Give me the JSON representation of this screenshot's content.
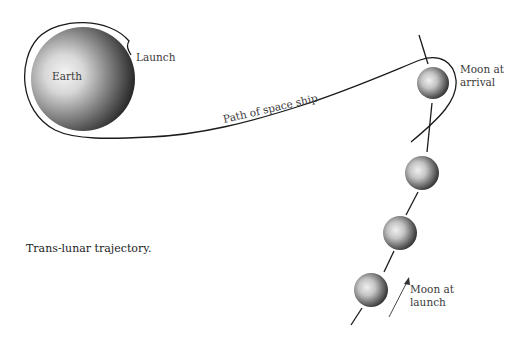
{
  "diagram": {
    "caption": "Trans-lunar trajectory.",
    "labels": {
      "earth": "Earth",
      "launch": "Launch",
      "path": "Path of space ship",
      "moon_arrival_line1": "Moon at",
      "moon_arrival_line2": "arrival",
      "moon_launch_line1": "Moon at",
      "moon_launch_line2": "launch"
    },
    "bodies": [
      {
        "name": "Earth",
        "cx": 83,
        "cy": 79,
        "r": 52
      },
      {
        "name": "Moon at arrival",
        "cx": 433,
        "cy": 83,
        "r": 16
      },
      {
        "name": "Moon position 2",
        "cx": 422,
        "cy": 173,
        "r": 17
      },
      {
        "name": "Moon position 3",
        "cx": 400,
        "cy": 233,
        "r": 17
      },
      {
        "name": "Moon at launch",
        "cx": 371,
        "cy": 290,
        "r": 17
      }
    ],
    "colors": {
      "line": "#1a1a1a",
      "sphere_light": "#f2f2f2",
      "sphere_dark": "#1e1e1e"
    }
  }
}
